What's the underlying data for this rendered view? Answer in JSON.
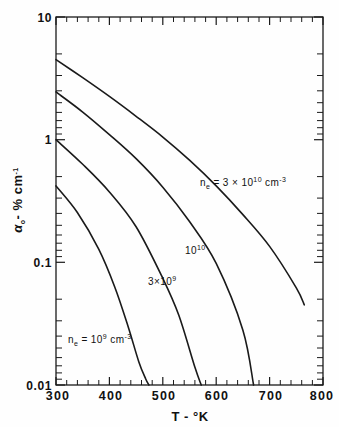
{
  "figure": {
    "title": "",
    "background": "#fefefe",
    "ink": "#1a1a1a"
  },
  "axes": {
    "x": {
      "label": "T - °K",
      "label_plain": "T - degK",
      "min": 300,
      "max": 800,
      "scale": "linear",
      "major_ticks": [
        300,
        400,
        500,
        600,
        700,
        800
      ],
      "tick_labels": [
        "300",
        "400",
        "500",
        "600",
        "700",
        "800"
      ],
      "minor_step": 20
    },
    "y": {
      "label": "α₀ - % cm⁻¹",
      "label_symbol": "α",
      "label_subscript": "o",
      "label_tail": "- % cm",
      "label_exponent": "-1",
      "min": 0.01,
      "max": 10,
      "scale": "log",
      "decade_labels": [
        "10",
        "1",
        "0.1",
        "0.01"
      ],
      "decade_values": [
        10,
        1,
        0.1,
        0.01
      ]
    },
    "frame": {
      "left": 56,
      "right": 323,
      "top": 17,
      "bottom": 385
    }
  },
  "chart_data": {
    "type": "line",
    "title": "",
    "xlabel": "T - °K",
    "ylabel": "α₀ - % cm⁻¹",
    "xlim": [
      300,
      800
    ],
    "ylim": [
      0.01,
      10
    ],
    "yscale": "log",
    "xscale": "linear",
    "grid": false,
    "legend": "inline-annotations",
    "series": [
      {
        "name": "n_e = 3 × 10^10 cm^-3",
        "label": "nₑ = 3 × 10¹⁰ cm⁻³",
        "label_prefix": "n",
        "label_sub": "e",
        "label_mid": " = 3 × 10",
        "label_exp": "10",
        "label_unit": " cm",
        "label_unit_exp": "-3",
        "label_x": 560,
        "label_y": 0.42,
        "x": [
          300,
          350,
          400,
          450,
          500,
          550,
          600,
          650,
          700,
          750,
          765
        ],
        "y": [
          4.5,
          3.2,
          2.25,
          1.55,
          1.05,
          0.68,
          0.42,
          0.245,
          0.135,
          0.062,
          0.045
        ]
      },
      {
        "name": "n_e = 10^10 cm^-3",
        "label": "10¹⁰",
        "label_base": "10",
        "label_exp": "10",
        "label_x": 508,
        "label_y": 0.108,
        "x": [
          300,
          350,
          400,
          450,
          500,
          550,
          600,
          650,
          670
        ],
        "y": [
          2.45,
          1.68,
          1.1,
          0.7,
          0.41,
          0.215,
          0.098,
          0.028,
          0.01
        ]
      },
      {
        "name": "n_e = 3 × 10^9 cm^-3",
        "label": "3×10⁹",
        "label_base": "3×10",
        "label_exp": "9",
        "label_x": 430,
        "label_y": 0.063,
        "x": [
          300,
          350,
          400,
          450,
          500,
          530,
          560,
          572
        ],
        "y": [
          1.0,
          0.63,
          0.375,
          0.195,
          0.074,
          0.037,
          0.014,
          0.01
        ]
      },
      {
        "name": "n_e = 10^9 cm^-3",
        "label": "nₑ = 10⁹ cm⁻³",
        "label_prefix": "n",
        "label_sub": "e",
        "label_mid": " = 10",
        "label_exp": "9",
        "label_unit": " cm",
        "label_unit_exp": "-3",
        "label_x": 350,
        "label_y": 0.021,
        "x": [
          300,
          340,
          380,
          410,
          435,
          455,
          468,
          474
        ],
        "y": [
          0.42,
          0.255,
          0.128,
          0.063,
          0.03,
          0.0155,
          0.0112,
          0.01
        ]
      }
    ]
  }
}
